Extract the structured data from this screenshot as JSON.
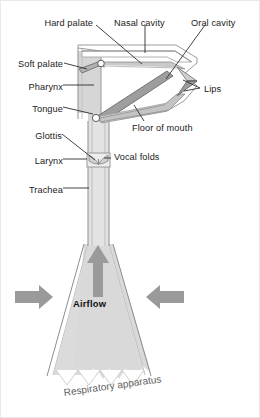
{
  "figure": {
    "title": "Respiratory apparatus",
    "caption": "Respiratory apparatus",
    "airflow_label": "Airflow",
    "colors": {
      "tissue_fill": "#d9d9d9",
      "tissue_fill_light": "#e6e6e6",
      "cavity_fill": "#ffffff",
      "outline": "#808080",
      "outline_dark": "#555555",
      "tongue_fill": "#a8a8a8",
      "arrow_fill": "#9a9a9a",
      "leader_line": "#3a3a3a",
      "text": "#1b1b1b",
      "caption_text": "#5e5e5e",
      "background": "#ffffff"
    }
  },
  "labels_left": [
    {
      "id": "hard-palate",
      "text": "Hard palate",
      "x": 34,
      "y": 17
    },
    {
      "id": "soft-palate",
      "text": "Soft palate",
      "x": 18,
      "y": 58
    },
    {
      "id": "pharynx",
      "text": "Pharynx",
      "x": 26,
      "y": 81
    },
    {
      "id": "tongue",
      "text": "Tongue",
      "x": 31,
      "y": 103
    },
    {
      "id": "glottis",
      "text": "Glottis",
      "x": 33,
      "y": 130
    },
    {
      "id": "larynx",
      "text": "Larynx",
      "x": 30,
      "y": 155
    },
    {
      "id": "trachea",
      "text": "Trachea",
      "x": 27,
      "y": 184
    }
  ],
  "labels_right": [
    {
      "id": "nasal-cavity",
      "text": "Nasal cavity",
      "x": 113,
      "y": 17
    },
    {
      "id": "oral-cavity",
      "text": "Oral cavity",
      "x": 190,
      "y": 17
    },
    {
      "id": "lips",
      "text": "Lips",
      "x": 202,
      "y": 84
    },
    {
      "id": "floor-of-mouth",
      "text": "Floor of mouth",
      "x": 131,
      "y": 123
    },
    {
      "id": "vocal-folds",
      "text": "Vocal folds",
      "x": 113,
      "y": 151
    }
  ],
  "airflow": {
    "label": "Airflow",
    "label_x": 72,
    "label_y": 297,
    "arrows": [
      {
        "id": "arrow-up",
        "direction": "up"
      },
      {
        "id": "arrow-left",
        "direction": "right"
      },
      {
        "id": "arrow-right",
        "direction": "left"
      }
    ]
  },
  "anatomy_parts": [
    "nasal cavity",
    "hard palate",
    "soft palate",
    "oral cavity",
    "lips",
    "tongue",
    "floor of mouth",
    "pharynx",
    "glottis",
    "vocal folds",
    "larynx",
    "trachea",
    "lungs"
  ],
  "caption": {
    "text": "Respiratory apparatus",
    "x": 62,
    "y": 388
  }
}
